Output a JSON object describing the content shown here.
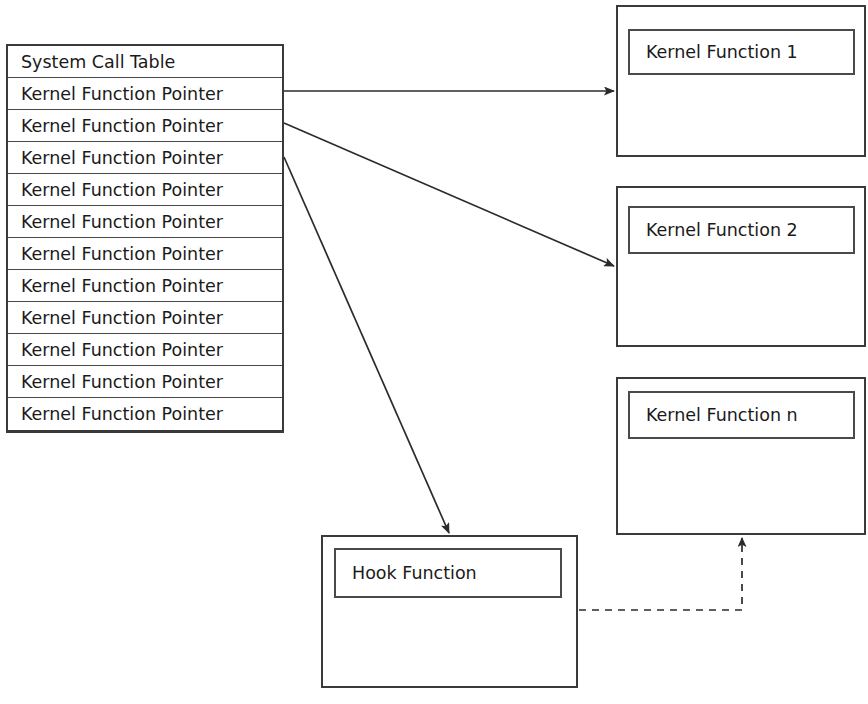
{
  "diagram": {
    "stroke_color": "#3a3a3a",
    "background_color": "#ffffff",
    "text_color": "#1a1a1a"
  },
  "syscall_table": {
    "header": "System Call Table",
    "rows": [
      "Kernel Function Pointer",
      "Kernel Function Pointer",
      "Kernel Function Pointer",
      "Kernel Function Pointer",
      "Kernel Function Pointer",
      "Kernel Function Pointer",
      "Kernel Function Pointer",
      "Kernel Function Pointer",
      "Kernel Function Pointer",
      "Kernel Function Pointer",
      "Kernel Function Pointer"
    ]
  },
  "kernel_functions": [
    {
      "label": "Kernel Function 1"
    },
    {
      "label": "Kernel Function 2"
    },
    {
      "label": "Kernel Function n"
    }
  ],
  "hook": {
    "label": "Hook Function"
  },
  "edges": [
    {
      "name": "pointer-1-to-kernel-function-1",
      "style": "solid",
      "from": "syscall-row-1",
      "to": "kernel-function-1"
    },
    {
      "name": "pointer-2-to-kernel-function-2",
      "style": "solid",
      "from": "syscall-row-2",
      "to": "kernel-function-2"
    },
    {
      "name": "pointer-3-to-hook-function",
      "style": "solid",
      "from": "syscall-row-3",
      "to": "hook-function"
    },
    {
      "name": "hook-function-to-kernel-function-n",
      "style": "dashed",
      "from": "hook-function",
      "to": "kernel-function-n"
    }
  ]
}
